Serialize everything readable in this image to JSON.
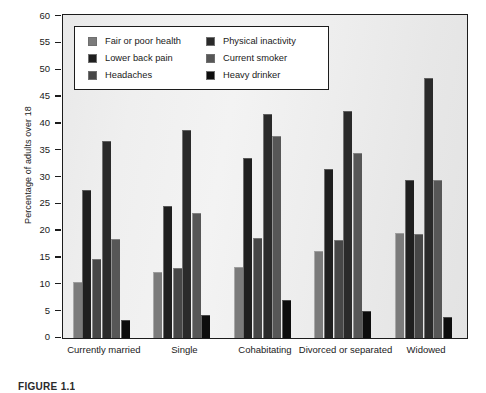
{
  "chart_data": {
    "type": "bar",
    "title": "",
    "xlabel": "",
    "ylabel": "Percentage of adults over 18",
    "ylim": [
      0,
      60
    ],
    "ytick_step": 5,
    "yticks": [
      0,
      5,
      10,
      15,
      20,
      25,
      30,
      35,
      40,
      45,
      50,
      55,
      60
    ],
    "grid": false,
    "legend_position": "upper-left-inside",
    "categories": [
      "Currently married",
      "Single",
      "Cohabitating",
      "Divorced or separated",
      "Widowed"
    ],
    "series": [
      {
        "name": "Fair or poor health",
        "color": "#7b7b7b",
        "values": [
          10.5,
          12.4,
          13.3,
          16.3,
          19.5
        ]
      },
      {
        "name": "Lower back pain",
        "color": "#1f1f1f",
        "values": [
          27.6,
          24.7,
          33.6,
          31.5,
          29.4
        ]
      },
      {
        "name": "Headaches",
        "color": "#474747",
        "values": [
          14.7,
          13.0,
          18.6,
          18.3,
          19.4
        ]
      },
      {
        "name": "Physical inactivity",
        "color": "#2a2a2a",
        "values": [
          36.8,
          38.8,
          41.7,
          42.4,
          48.5
        ]
      },
      {
        "name": "Current smoker",
        "color": "#575757",
        "values": [
          18.5,
          23.4,
          37.6,
          34.5,
          29.4
        ]
      },
      {
        "name": "Heavy drinker",
        "color": "#0d0d0d",
        "values": [
          3.3,
          4.3,
          7.1,
          5.1,
          4.0
        ]
      }
    ]
  },
  "axis": {
    "y_title": "Percentage of adults over 18",
    "y_tick_labels": [
      "60",
      "55",
      "50",
      "45",
      "40",
      "35",
      "30",
      "25",
      "20",
      "15",
      "10",
      "5",
      "0"
    ]
  },
  "legend": {
    "left_column": [
      {
        "label": "Fair or poor health",
        "color": "#7b7b7b"
      },
      {
        "label": "Lower back pain",
        "color": "#1f1f1f"
      },
      {
        "label": "Headaches",
        "color": "#474747"
      }
    ],
    "right_column": [
      {
        "label": "Physical inactivity",
        "color": "#2a2a2a"
      },
      {
        "label": "Current smoker",
        "color": "#575757"
      },
      {
        "label": "Heavy drinker",
        "color": "#0d0d0d"
      }
    ]
  },
  "caption": {
    "text": "FIGURE 1.1"
  }
}
